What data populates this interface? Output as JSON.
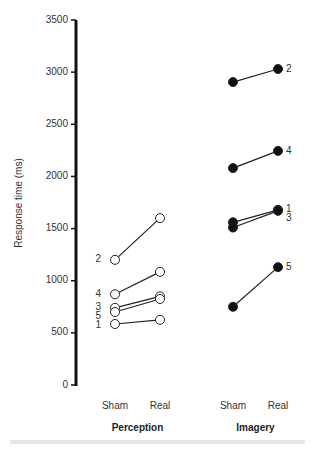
{
  "chart_data": {
    "type": "line",
    "title": "",
    "ylabel": "Response time (ms)",
    "xlabel": "",
    "ylim": [
      0,
      3500
    ],
    "yticks": [
      0,
      500,
      1000,
      1500,
      2000,
      2500,
      3000,
      3500
    ],
    "ytick_labels": [
      "0",
      "500",
      "1000",
      "1500",
      "2000",
      "2500",
      "3000",
      "3500"
    ],
    "grid": false,
    "legend": "none",
    "categories": [
      "Sham",
      "Real"
    ],
    "groups": [
      {
        "name": "Perception",
        "marker": "open-circle",
        "series": [
          {
            "name": "1",
            "values": [
              585,
              625
            ]
          },
          {
            "name": "2",
            "values": [
              1200,
              1600
            ]
          },
          {
            "name": "3",
            "values": [
              740,
              850
            ]
          },
          {
            "name": "4",
            "values": [
              870,
              1085
            ]
          },
          {
            "name": "5",
            "values": [
              700,
              825
            ]
          }
        ],
        "label_side": "left",
        "label_order": [
          "2",
          "4",
          "3",
          "5",
          "1"
        ]
      },
      {
        "name": "Imagery",
        "marker": "filled-circle",
        "series": [
          {
            "name": "1",
            "values": [
              1560,
              1680
            ]
          },
          {
            "name": "2",
            "values": [
              2905,
              3030
            ]
          },
          {
            "name": "3",
            "values": [
              1510,
              1670
            ]
          },
          {
            "name": "4",
            "values": [
              2080,
              2245
            ]
          },
          {
            "name": "5",
            "values": [
              750,
              1130
            ]
          }
        ],
        "label_side": "right",
        "label_order": [
          "2",
          "4",
          "1",
          "3",
          "5"
        ]
      }
    ]
  },
  "colors": {
    "axis": "#111111",
    "line": "#222222",
    "marker_fill_open": "#ffffff",
    "marker_fill_filled": "#111111",
    "text": "#333333"
  }
}
